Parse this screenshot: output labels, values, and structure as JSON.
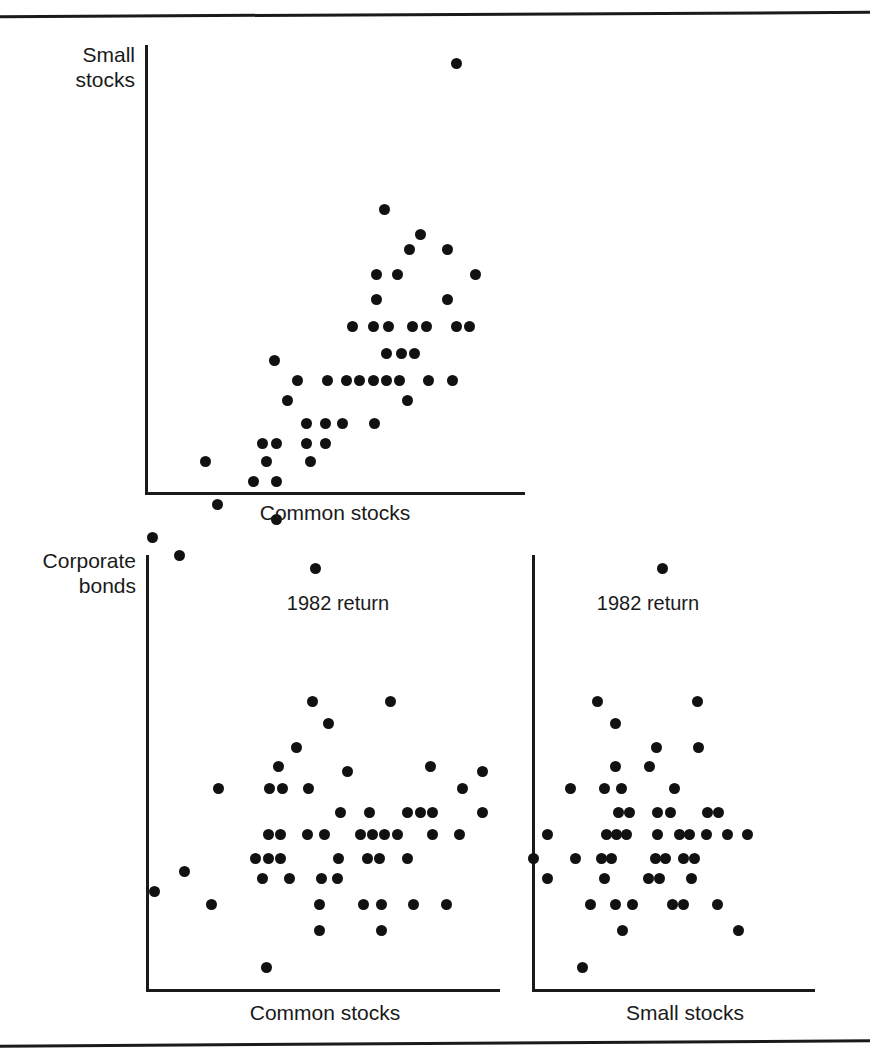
{
  "figure": {
    "kind": "scatterplot-matrix",
    "rules": [
      "top-rule",
      "bottom-rule"
    ],
    "ink_color": "#111111"
  },
  "chart_data": [
    {
      "id": "small-vs-common",
      "type": "scatter",
      "title": "",
      "xlabel": "Common stocks",
      "ylabel": "Small stocks",
      "grid": false,
      "legend": null,
      "xlim": [
        0,
        100
      ],
      "ylim": [
        0,
        100
      ],
      "annotations": [],
      "points": [
        [
          82.0,
          96.0
        ],
        [
          63.0,
          63.5
        ],
        [
          72.5,
          58.0
        ],
        [
          69.5,
          54.5
        ],
        [
          79.5,
          54.5
        ],
        [
          61.0,
          49.0
        ],
        [
          66.5,
          49.0
        ],
        [
          87.0,
          49.0
        ],
        [
          61.0,
          43.5
        ],
        [
          79.5,
          43.5
        ],
        [
          54.5,
          37.5
        ],
        [
          60.0,
          37.5
        ],
        [
          64.0,
          37.5
        ],
        [
          70.5,
          37.5
        ],
        [
          74.0,
          37.5
        ],
        [
          82.0,
          37.5
        ],
        [
          85.5,
          37.5
        ],
        [
          63.5,
          31.5
        ],
        [
          67.5,
          31.5
        ],
        [
          71.0,
          31.5
        ],
        [
          34.0,
          30.0
        ],
        [
          40.0,
          25.5
        ],
        [
          48.0,
          25.5
        ],
        [
          53.0,
          25.5
        ],
        [
          56.5,
          25.5
        ],
        [
          60.0,
          25.5
        ],
        [
          63.5,
          25.5
        ],
        [
          67.0,
          25.5
        ],
        [
          74.5,
          25.5
        ],
        [
          81.0,
          25.5
        ],
        [
          37.5,
          21.0
        ],
        [
          69.0,
          21.0
        ],
        [
          42.5,
          16.0
        ],
        [
          47.5,
          16.0
        ],
        [
          52.0,
          16.0
        ],
        [
          60.5,
          16.0
        ],
        [
          31.0,
          11.5
        ],
        [
          34.5,
          11.5
        ],
        [
          42.5,
          11.5
        ],
        [
          47.5,
          11.5
        ],
        [
          16.0,
          7.5
        ],
        [
          32.0,
          7.5
        ],
        [
          43.5,
          7.5
        ],
        [
          28.5,
          3.0
        ],
        [
          34.5,
          3.0
        ],
        [
          19.0,
          -2.0
        ],
        [
          34.5,
          -5.5
        ],
        [
          2.0,
          -9.5
        ],
        [
          9.0,
          -13.5
        ]
      ]
    },
    {
      "id": "bonds-vs-common",
      "type": "scatter",
      "title": "",
      "xlabel": "Common stocks",
      "ylabel": "Corporate bonds",
      "grid": false,
      "legend": null,
      "xlim": [
        0,
        100
      ],
      "ylim": [
        0,
        100
      ],
      "annotations": [
        {
          "text": "1982 return",
          "x": 48.0,
          "y": 86.0
        }
      ],
      "points": [
        [
          48.0,
          97.0
        ],
        [
          47.0,
          66.5
        ],
        [
          69.0,
          66.5
        ],
        [
          51.5,
          61.5
        ],
        [
          42.5,
          56.0
        ],
        [
          37.5,
          51.5
        ],
        [
          80.5,
          51.5
        ],
        [
          57.0,
          50.5
        ],
        [
          95.0,
          50.5
        ],
        [
          20.5,
          46.5
        ],
        [
          35.0,
          46.5
        ],
        [
          38.5,
          46.5
        ],
        [
          46.0,
          46.5
        ],
        [
          89.5,
          46.5
        ],
        [
          55.0,
          41.0
        ],
        [
          63.0,
          41.0
        ],
        [
          74.0,
          41.0
        ],
        [
          77.5,
          41.0
        ],
        [
          81.0,
          41.0
        ],
        [
          95.0,
          41.0
        ],
        [
          34.5,
          36.0
        ],
        [
          38.0,
          36.0
        ],
        [
          45.5,
          36.0
        ],
        [
          50.5,
          36.0
        ],
        [
          60.5,
          36.0
        ],
        [
          64.0,
          36.0
        ],
        [
          67.5,
          36.0
        ],
        [
          71.0,
          36.0
        ],
        [
          81.0,
          36.0
        ],
        [
          88.5,
          36.0
        ],
        [
          31.0,
          30.5
        ],
        [
          34.5,
          30.5
        ],
        [
          38.0,
          30.5
        ],
        [
          54.5,
          30.5
        ],
        [
          62.5,
          30.5
        ],
        [
          66.0,
          30.5
        ],
        [
          74.0,
          30.5
        ],
        [
          11.0,
          27.5
        ],
        [
          33.0,
          26.0
        ],
        [
          40.5,
          26.0
        ],
        [
          49.5,
          26.0
        ],
        [
          54.0,
          26.0
        ],
        [
          2.5,
          23.0
        ],
        [
          18.5,
          20.0
        ],
        [
          49.0,
          20.0
        ],
        [
          61.5,
          20.0
        ],
        [
          66.5,
          20.0
        ],
        [
          75.5,
          20.0
        ],
        [
          85.0,
          20.0
        ],
        [
          49.0,
          14.0
        ],
        [
          66.5,
          14.0
        ],
        [
          34.0,
          5.5
        ]
      ]
    },
    {
      "id": "bonds-vs-small",
      "type": "scatter",
      "title": "",
      "xlabel": "Small stocks",
      "ylabel": "Corporate bonds",
      "grid": false,
      "legend": null,
      "xlim": [
        0,
        100
      ],
      "ylim": [
        0,
        100
      ],
      "annotations": [
        {
          "text": "1982 return",
          "x": 46.0,
          "y": 86.0
        }
      ],
      "points": [
        [
          46.0,
          97.0
        ],
        [
          23.0,
          66.5
        ],
        [
          58.5,
          66.5
        ],
        [
          29.5,
          61.5
        ],
        [
          44.0,
          56.0
        ],
        [
          59.0,
          56.0
        ],
        [
          29.5,
          51.5
        ],
        [
          41.5,
          51.5
        ],
        [
          13.5,
          46.5
        ],
        [
          25.5,
          46.5
        ],
        [
          31.5,
          46.5
        ],
        [
          50.5,
          46.5
        ],
        [
          30.5,
          41.0
        ],
        [
          34.5,
          41.0
        ],
        [
          44.5,
          41.0
        ],
        [
          49.0,
          41.0
        ],
        [
          62.0,
          41.0
        ],
        [
          66.0,
          41.0
        ],
        [
          5.5,
          36.0
        ],
        [
          26.5,
          36.0
        ],
        [
          30.0,
          36.0
        ],
        [
          33.5,
          36.0
        ],
        [
          44.5,
          36.0
        ],
        [
          52.0,
          36.0
        ],
        [
          55.5,
          36.0
        ],
        [
          61.5,
          36.0
        ],
        [
          69.0,
          36.0
        ],
        [
          76.0,
          36.0
        ],
        [
          0.5,
          30.5
        ],
        [
          15.5,
          30.5
        ],
        [
          24.5,
          30.5
        ],
        [
          28.0,
          30.5
        ],
        [
          43.5,
          30.5
        ],
        [
          47.0,
          30.5
        ],
        [
          53.5,
          30.5
        ],
        [
          57.5,
          30.5
        ],
        [
          5.5,
          26.0
        ],
        [
          25.5,
          26.0
        ],
        [
          41.0,
          26.0
        ],
        [
          45.0,
          26.0
        ],
        [
          56.5,
          26.0
        ],
        [
          20.5,
          20.0
        ],
        [
          29.5,
          20.0
        ],
        [
          35.5,
          20.0
        ],
        [
          49.5,
          20.0
        ],
        [
          53.5,
          20.0
        ],
        [
          65.5,
          20.0
        ],
        [
          32.0,
          14.0
        ],
        [
          73.0,
          14.0
        ],
        [
          18.0,
          5.5
        ]
      ]
    }
  ]
}
